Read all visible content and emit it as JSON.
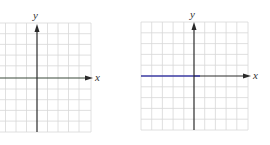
{
  "graphs": [
    {
      "id": "left",
      "y_label": "y",
      "x_label": "x",
      "grid": {
        "left": 0,
        "top": 23,
        "right": 91,
        "bottom": 132,
        "cell": 10.5
      },
      "origin": {
        "x": 37,
        "y": 78
      },
      "plotted_line": null,
      "colors": {
        "grid": "#d8d8d8",
        "axis": "#2a2a2a",
        "x_axis": "#3a4a3a"
      }
    },
    {
      "id": "right",
      "y_label": "y",
      "x_label": "x",
      "grid": {
        "left": 141,
        "top": 22,
        "right": 248,
        "bottom": 130,
        "cell": 10.7
      },
      "origin": {
        "x": 194,
        "y": 76
      },
      "plotted_line": {
        "type": "horizontal",
        "equation": "y = 0",
        "color": "#3a3aa0"
      },
      "colors": {
        "grid": "#d8d8d8",
        "axis": "#2a2a2a"
      }
    }
  ]
}
